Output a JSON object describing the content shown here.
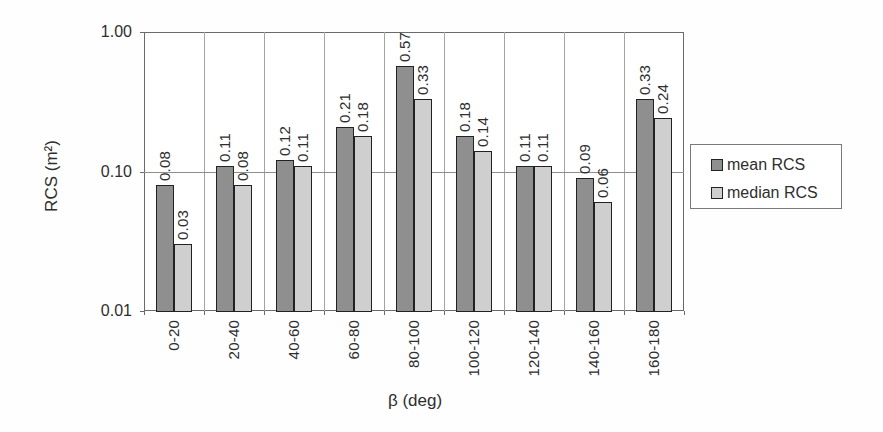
{
  "chart_data": {
    "type": "bar",
    "title": "",
    "xlabel": "β (deg)",
    "ylabel": "RCS (m²)",
    "y_scale": "log",
    "ylim": [
      0.01,
      1.0
    ],
    "y_ticks": [
      {
        "value": 1.0,
        "label": "1.00"
      },
      {
        "value": 0.1,
        "label": "0.10"
      },
      {
        "value": 0.01,
        "label": "0.01"
      }
    ],
    "categories": [
      "0-20",
      "20-40",
      "40-60",
      "60-80",
      "80-100",
      "100-120",
      "120-140",
      "140-160",
      "160-180"
    ],
    "series": [
      {
        "name": "mean RCS",
        "color": "#8f8f8f",
        "values": [
          0.08,
          0.11,
          0.12,
          0.21,
          0.57,
          0.18,
          0.11,
          0.09,
          0.33
        ],
        "labels": [
          "0.08",
          "0.11",
          "0.12",
          "0.21",
          "0.57",
          "0.18",
          "0.11",
          "0.09",
          "0.33"
        ]
      },
      {
        "name": "median RCS",
        "color": "#cfcfcf",
        "values": [
          0.03,
          0.08,
          0.11,
          0.18,
          0.33,
          0.14,
          0.11,
          0.06,
          0.24
        ],
        "labels": [
          "0.03",
          "0.08",
          "0.11",
          "0.18",
          "0.33",
          "0.14",
          "0.11",
          "0.06",
          "0.24"
        ]
      }
    ],
    "legend_position": "right",
    "grid": true,
    "bar_border_color": "#222222"
  }
}
